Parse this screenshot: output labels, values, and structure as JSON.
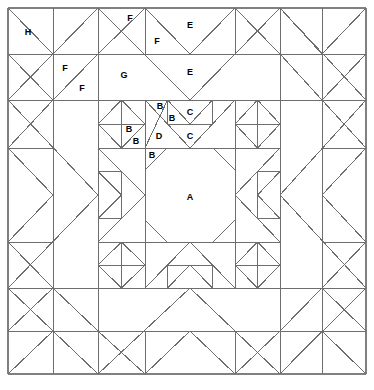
{
  "diagram": {
    "type": "quilt-block-line-drawing",
    "canvas": {
      "width": 374,
      "height": 390
    },
    "block": {
      "x": 8,
      "y": 8,
      "width": 358,
      "height": 366
    },
    "style": {
      "background": "#ffffff",
      "line_color": "#6e6e6e",
      "border_color": "#808080",
      "label_color": "#000000",
      "line_width": 1,
      "label_font_size": 9
    },
    "grid": {
      "columns": [
        8,
        53,
        98,
        145,
        190,
        235,
        280,
        322,
        366
      ],
      "rows": [
        8,
        54,
        100,
        148,
        195,
        242,
        288,
        331,
        374
      ]
    },
    "piece_labels": [
      {
        "id": "A",
        "text": "A",
        "x": 190,
        "y": 197
      },
      {
        "id": "B1",
        "text": "B",
        "x": 160,
        "y": 106
      },
      {
        "id": "B2",
        "text": "B",
        "x": 172,
        "y": 118
      },
      {
        "id": "B3",
        "text": "B",
        "x": 129,
        "y": 129
      },
      {
        "id": "B4",
        "text": "B",
        "x": 136,
        "y": 141
      },
      {
        "id": "B5",
        "text": "B",
        "x": 152,
        "y": 155
      },
      {
        "id": "C1",
        "text": "C",
        "x": 190,
        "y": 112
      },
      {
        "id": "C2",
        "text": "C",
        "x": 190,
        "y": 136
      },
      {
        "id": "D",
        "text": "D",
        "x": 159,
        "y": 136
      },
      {
        "id": "E1",
        "text": "E",
        "x": 190,
        "y": 25
      },
      {
        "id": "E2",
        "text": "E",
        "x": 190,
        "y": 72
      },
      {
        "id": "F1",
        "text": "F",
        "x": 130,
        "y": 18
      },
      {
        "id": "F2",
        "text": "F",
        "x": 157,
        "y": 41
      },
      {
        "id": "F3",
        "text": "F",
        "x": 65,
        "y": 68
      },
      {
        "id": "F4",
        "text": "F",
        "x": 82,
        "y": 88
      },
      {
        "id": "G",
        "text": "G",
        "x": 124,
        "y": 75
      },
      {
        "id": "H",
        "text": "H",
        "x": 28,
        "y": 32
      }
    ],
    "legend_note": "Pieces labelled A (center square), B (small triangles), C (flying-geese triangles), D (corner squares), E (large triangles), F (medium triangles), G (large corner triangle), H (corner square)"
  }
}
